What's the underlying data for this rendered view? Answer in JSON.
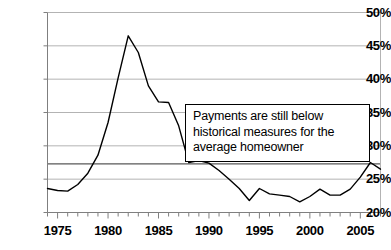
{
  "chart_data": {
    "type": "line",
    "title": "",
    "subtitle": "",
    "xlabel": "",
    "ylabel": "",
    "xlim": [
      1974,
      2007
    ],
    "ylim": [
      20,
      50
    ],
    "ytick_labels": [
      "20%",
      "25%",
      "30%",
      "35%",
      "40%",
      "45%",
      "50%"
    ],
    "ytick_values": [
      20,
      25,
      30,
      35,
      40,
      45,
      50
    ],
    "xtick_labels": [
      "1975",
      "1980",
      "1985",
      "1990",
      "1995",
      "2000",
      "2005"
    ],
    "xtick_values": [
      1975,
      1980,
      1985,
      1990,
      1995,
      2000,
      2005
    ],
    "grid": "horizontal",
    "legend": "none",
    "line_color": "#000000",
    "gridline_color": "#b3b3b3",
    "axis_color": "#7f7f7f",
    "reference_line": {
      "label": "historical average",
      "value": 27.3,
      "color": "#595959"
    },
    "x": [
      1974,
      1975,
      1976,
      1977,
      1978,
      1979,
      1980,
      1981,
      1982,
      1983,
      1984,
      1985,
      1986,
      1987,
      1988,
      1989,
      1990,
      1991,
      1992,
      1993,
      1994,
      1995,
      1996,
      1997,
      1998,
      1999,
      2000,
      2001,
      2002,
      2003,
      2004,
      2005,
      2006,
      2007
    ],
    "values": [
      23.6,
      23.3,
      23.2,
      24.2,
      25.9,
      28.6,
      33.5,
      40.2,
      46.5,
      44.0,
      39.0,
      36.6,
      36.5,
      33.0,
      27.5,
      27.8,
      27.4,
      26.3,
      25.0,
      23.6,
      21.8,
      23.6,
      22.8,
      22.6,
      22.4,
      21.6,
      22.4,
      23.5,
      22.6,
      22.6,
      23.5,
      25.3,
      27.5,
      26.5
    ],
    "annotation": {
      "lines": [
        "Payments are still below",
        "historical measures for the",
        "average homeowner"
      ],
      "border_color": "#000000",
      "background_color": "#ffffff"
    }
  }
}
